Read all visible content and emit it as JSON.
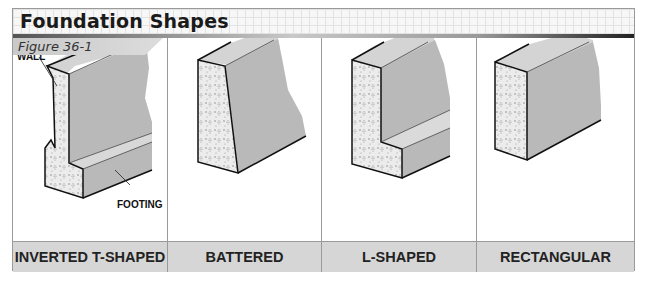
{
  "header": {
    "title": "Foundation Shapes",
    "figure_label": "Figure 36-1"
  },
  "panels": [
    {
      "label": "INVERTED T-SHAPED",
      "callouts": [
        "WALL",
        "FOOTING"
      ]
    },
    {
      "label": "BATTERED"
    },
    {
      "label": "L-SHAPED"
    },
    {
      "label": "RECTANGULAR"
    }
  ],
  "colors": {
    "concrete_face": "#b9b9b9",
    "concrete_top": "#d4d4d4",
    "cut_section": "#ececec",
    "label_row": "#d6d6d6",
    "border": "#9a9a9a"
  }
}
